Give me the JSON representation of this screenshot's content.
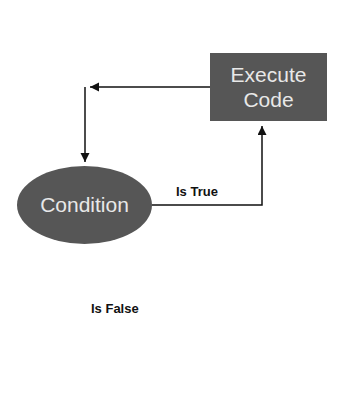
{
  "diagram": {
    "type": "flowchart-loop",
    "nodes": {
      "execute": {
        "line1": "Execute",
        "line2": "Code"
      },
      "condition": {
        "label": "Condition"
      }
    },
    "edges": {
      "true_label": "Is True",
      "false_label": "Is False"
    },
    "colors": {
      "node_fill": "#565656",
      "node_text": "#e8e8e8",
      "line": "#111111"
    }
  }
}
